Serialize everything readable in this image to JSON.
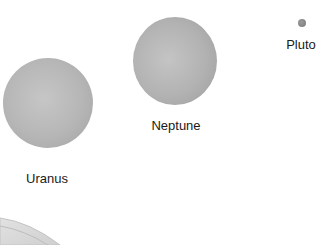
{
  "diagram": {
    "planets": [
      {
        "name": "Uranus",
        "color": "#b4b4b4"
      },
      {
        "name": "Neptune",
        "color": "#b0b0b0"
      },
      {
        "name": "Pluto",
        "color": "#8a8a8a"
      }
    ],
    "partial_body": {
      "name": "Saturn (partial, ring edge)"
    }
  }
}
